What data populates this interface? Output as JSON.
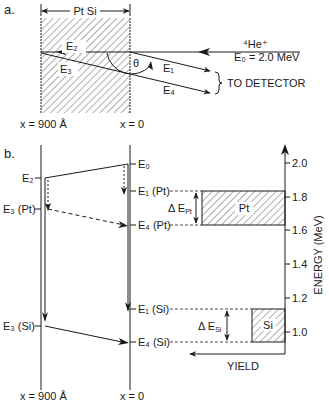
{
  "part_a": {
    "label": "a.",
    "material": "Pt Si",
    "beam": "⁴He⁺",
    "beam_energy": "E₀ = 2.0 MeV",
    "detector": "TO DETECTOR",
    "theta": "θ",
    "e1": "E₁",
    "e2": "E₂",
    "e3": "E₃",
    "e4": "E₄",
    "x_back": "x = 900 Å",
    "x_front": "x = 0"
  },
  "part_b": {
    "label": "b.",
    "left_labels": [
      "E₂",
      "E₃ (Pt)",
      "E₃ (Si)"
    ],
    "right_labels": [
      "E₀",
      "E₁ (Pt)",
      "E₄ (Pt)",
      "E₁ (Si)",
      "E₄ (Si)"
    ],
    "delta_pt": "Δ E",
    "delta_pt_sub": "Pt",
    "delta_si": "Δ E",
    "delta_si_sub": "Si",
    "peak_pt": "Pt",
    "peak_si": "Si",
    "yield_label": "YIELD",
    "axis_label": "ENERGY (MeV)",
    "ticks": [
      "2.0",
      "1.8",
      "1.6",
      "1.4",
      "1.2",
      "1.0"
    ],
    "x_back": "x = 900 Å",
    "x_front": "x = 0"
  }
}
